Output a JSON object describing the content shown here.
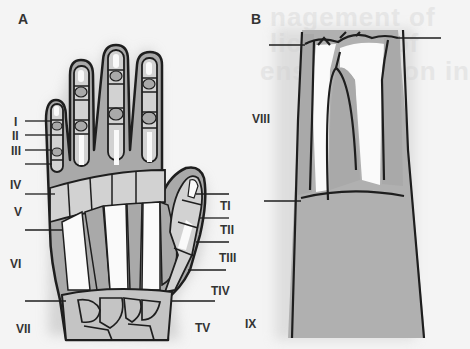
{
  "figure": {
    "background_text": [
      "nagement of",
      "lications of",
      "ensor tendon in"
    ],
    "panels": [
      {
        "id": "A",
        "label": "A",
        "subject": "dorsal hand",
        "zones": [
          {
            "label": "I",
            "y": 121
          },
          {
            "label": "II",
            "y": 135
          },
          {
            "label": "III",
            "y": 150
          },
          {
            "label": "IV",
            "y": 184
          },
          {
            "label": "V",
            "y": 211
          },
          {
            "label": "VI",
            "y": 262
          },
          {
            "label": "VII",
            "y": 323
          }
        ],
        "thumb_zones": [
          {
            "label": "TI",
            "y": 206
          },
          {
            "label": "TII",
            "y": 229
          },
          {
            "label": "TIII",
            "y": 257
          },
          {
            "label": "TIV",
            "y": 290
          },
          {
            "label": "TV",
            "y": 328
          }
        ]
      },
      {
        "id": "B",
        "label": "B",
        "subject": "forearm",
        "zones": [
          {
            "label": "VIII",
            "y": 118
          },
          {
            "label": "IX",
            "y": 323
          }
        ]
      }
    ]
  },
  "colors": {
    "background": "#f4f4f4",
    "skin_shade": "#a8a8a8",
    "bone_light": "#d4d4d4",
    "tendon_white": "#fafafa",
    "outline": "#1e1e1e"
  }
}
